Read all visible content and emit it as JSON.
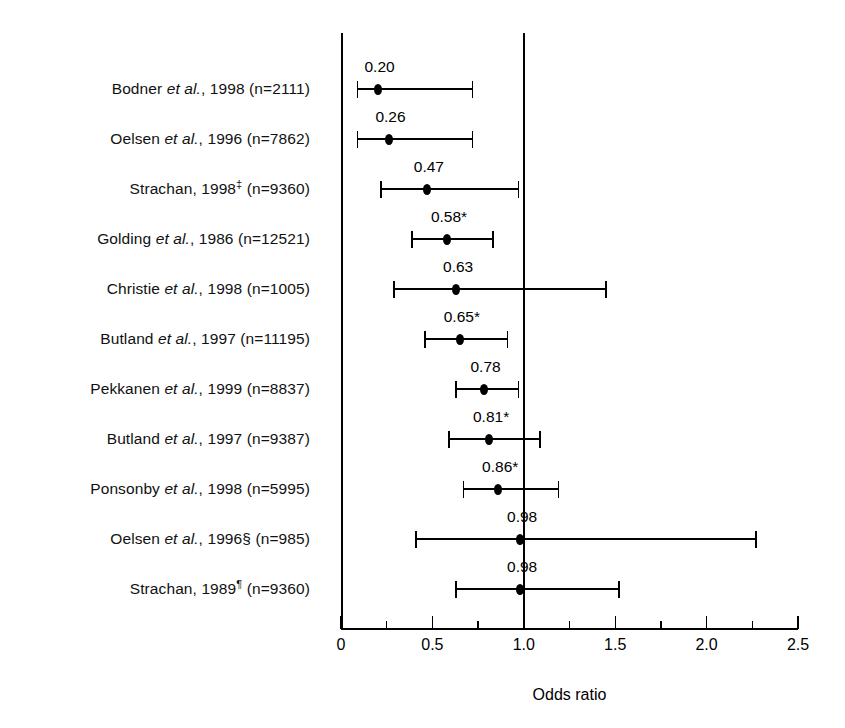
{
  "chart_data": {
    "type": "scatter",
    "plot_kind": "forest-plot",
    "title": "",
    "xlabel": "Odds ratio",
    "ylabel": "",
    "xlim": [
      0,
      2.5
    ],
    "grid": false,
    "reference_line": 1.0,
    "x_major_ticks": [
      0,
      0.5,
      1.0,
      1.5,
      2.0,
      2.5
    ],
    "x_minor_ticks": [
      0.25,
      0.75,
      1.25,
      1.75,
      2.25
    ],
    "x_tick_labels": [
      "0",
      "0.5",
      "1.0",
      "1.5",
      "2.0",
      "2.5"
    ],
    "significance_marker": "*",
    "studies": [
      {
        "author": "Bodner",
        "etal": "et al.",
        "year": "1998",
        "dagger": "",
        "n": "2111",
        "label_prefix": "Bodner ",
        "label_suffix": ", 1998 (n=2111)",
        "value": 0.2,
        "value_label": "0.20",
        "ci_low": 0.09,
        "ci_high": 0.72,
        "significant": false
      },
      {
        "author": "Oelsen",
        "etal": "et al.",
        "year": "1996",
        "dagger": "",
        "n": "7862",
        "label_prefix": "Oelsen ",
        "label_suffix": ", 1996 (n=7862)",
        "value": 0.26,
        "value_label": "0.26",
        "ci_low": 0.09,
        "ci_high": 0.72,
        "significant": false
      },
      {
        "author": "Strachan",
        "etal": "",
        "year": "1998",
        "dagger": "‡",
        "n": "9360",
        "label_prefix": "Strachan, 1998",
        "label_suffix": " (n=9360)",
        "value": 0.47,
        "value_label": "0.47",
        "ci_low": 0.22,
        "ci_high": 0.97,
        "significant": false
      },
      {
        "author": "Golding",
        "etal": "et al.",
        "year": "1986",
        "dagger": "",
        "n": "12521",
        "label_prefix": "Golding ",
        "label_suffix": ", 1986 (n=12521)",
        "value": 0.58,
        "value_label": "0.58*",
        "ci_low": 0.39,
        "ci_high": 0.83,
        "significant": true
      },
      {
        "author": "Christie",
        "etal": "et al.",
        "year": "1998",
        "dagger": "",
        "n": "1005",
        "label_prefix": "Christie ",
        "label_suffix": ", 1998 (n=1005)",
        "value": 0.63,
        "value_label": "0.63",
        "ci_low": 0.29,
        "ci_high": 1.45,
        "significant": false
      },
      {
        "author": "Butland",
        "etal": "et al.",
        "year": "1997",
        "dagger": "",
        "n": "11195",
        "label_prefix": "Butland ",
        "label_suffix": ", 1997 (n=11195)",
        "value": 0.65,
        "value_label": "0.65*",
        "ci_low": 0.46,
        "ci_high": 0.91,
        "significant": true
      },
      {
        "author": "Pekkanen",
        "etal": "et al.",
        "year": "1999",
        "dagger": "",
        "n": "8837",
        "label_prefix": "Pekkanen ",
        "label_suffix": ", 1999 (n=8837)",
        "value": 0.78,
        "value_label": "0.78",
        "ci_low": 0.63,
        "ci_high": 0.97,
        "significant": false
      },
      {
        "author": "Butland",
        "etal": "et al.",
        "year": "1997",
        "dagger": "",
        "n": "9387",
        "label_prefix": "Butland ",
        "label_suffix": ", 1997 (n=9387)",
        "value": 0.81,
        "value_label": "0.81*",
        "ci_low": 0.59,
        "ci_high": 1.09,
        "significant": true
      },
      {
        "author": "Ponsonby",
        "etal": "et al.",
        "year": "1998",
        "dagger": "",
        "n": "5995",
        "label_prefix": "Ponsonby ",
        "label_suffix": ", 1998 (n=5995)",
        "value": 0.86,
        "value_label": "0.86*",
        "ci_low": 0.67,
        "ci_high": 1.19,
        "significant": true
      },
      {
        "author": "Oelsen",
        "etal": "et al.",
        "year": "1996",
        "dagger": "§",
        "n": "985",
        "label_prefix": "Oelsen ",
        "label_suffix": ", 1996§ (n=985)",
        "value": 0.98,
        "value_label": "0.98",
        "ci_low": 0.41,
        "ci_high": 2.27,
        "significant": false
      },
      {
        "author": "Strachan",
        "etal": "",
        "year": "1989",
        "dagger": "¶",
        "n": "9360",
        "label_prefix": "Strachan, 1989",
        "label_suffix": " (n=9360)",
        "value": 0.98,
        "value_label": "0.98",
        "ci_low": 0.63,
        "ci_high": 1.52,
        "significant": false
      }
    ]
  },
  "style": {
    "ink": "#000000",
    "paper": "#ffffff"
  }
}
